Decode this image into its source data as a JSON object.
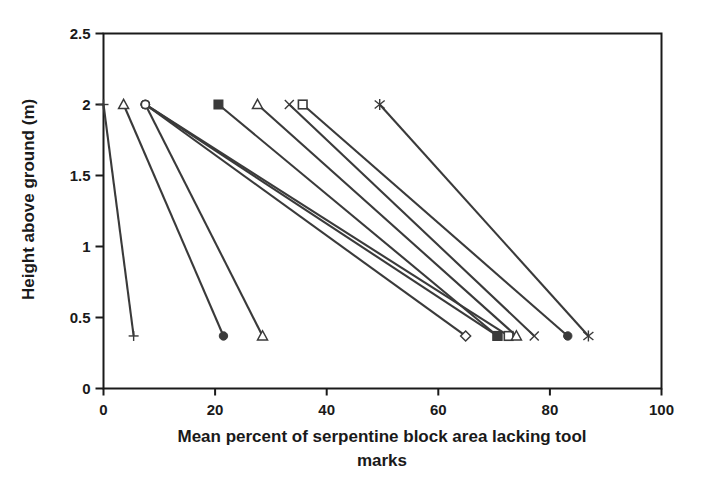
{
  "chart_data": {
    "type": "line",
    "title": "",
    "subtitle": "",
    "xlabel": "Mean percent of serpentine block area lacking tool marks",
    "ylabel": "Height above ground (m)",
    "xlim": [
      0,
      100
    ],
    "ylim": [
      0,
      2.5
    ],
    "xticks": [
      0,
      20,
      40,
      60,
      80,
      100
    ],
    "yticks": [
      0,
      0.5,
      1,
      1.5,
      2,
      2.5
    ],
    "xtick_labels": [
      "0",
      "20",
      "40",
      "60",
      "80",
      "100"
    ],
    "ytick_labels": [
      "0",
      "0.5",
      "1",
      "1.5",
      "2",
      "2.5"
    ],
    "grid": false,
    "legend": false,
    "legend_position": "none",
    "series": [
      {
        "name": "series-1-plus",
        "marker": "plus",
        "x": [
          0.0,
          5.4
        ],
        "y": [
          2.0,
          0.37
        ]
      },
      {
        "name": "series-2-open-triangle",
        "marker": "open-triangle",
        "x": [
          3.6,
          21.5
        ],
        "y": [
          2.0,
          0.37
        ]
      },
      {
        "name": "series-3-open-circle",
        "marker": "open-circle",
        "x": [
          7.5,
          28.5
        ],
        "y": [
          2.0,
          0.37
        ]
      },
      {
        "name": "series-4-open-circle-b",
        "marker": "open-circle",
        "x": [
          7.5,
          64.9
        ],
        "y": [
          2.0,
          0.37
        ]
      },
      {
        "name": "series-5-open-circle-c",
        "marker": "open-circle",
        "x": [
          7.5,
          70.6
        ],
        "y": [
          2.0,
          0.37
        ]
      },
      {
        "name": "series-6-open-circle-d",
        "marker": "open-circle",
        "x": [
          7.5,
          72.6
        ],
        "y": [
          2.0,
          0.37
        ]
      },
      {
        "name": "series-7-filled-square",
        "marker": "filled-square",
        "x": [
          20.6,
          70.6
        ],
        "y": [
          2.0,
          0.37
        ]
      },
      {
        "name": "series-8-open-triangle-b",
        "marker": "open-triangle",
        "x": [
          27.6,
          74.0
        ],
        "y": [
          2.0,
          0.37
        ]
      },
      {
        "name": "series-9-cross-x",
        "marker": "cross-x",
        "x": [
          33.3,
          77.2
        ],
        "y": [
          2.0,
          0.37
        ]
      },
      {
        "name": "series-10-open-square",
        "marker": "open-square",
        "x": [
          35.7,
          83.2
        ],
        "y": [
          2.0,
          0.37
        ]
      },
      {
        "name": "series-11-asterisk",
        "marker": "asterisk",
        "x": [
          49.5,
          86.9
        ],
        "y": [
          2.0,
          0.37
        ]
      }
    ]
  },
  "axes": {
    "x_title": "Mean percent of serpentine block area lacking tool marks",
    "y_title": "Height above ground (m)"
  }
}
